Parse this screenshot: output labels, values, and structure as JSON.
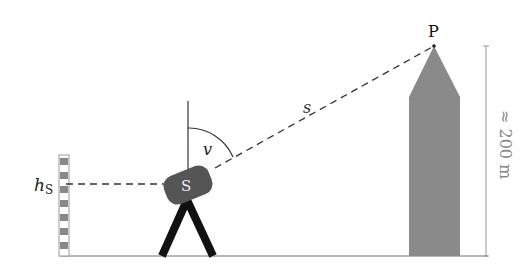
{
  "diagram": {
    "type": "trigonometric-height-measurement",
    "labels": {
      "point": "P",
      "distance": "s",
      "angle": "v",
      "station": "S",
      "station_height": "h",
      "station_height_sub": "S",
      "object_height": "≈ 200 m"
    },
    "colors": {
      "tower": "#8a8a8a",
      "instrument": "#555555",
      "tripod": "#111111",
      "line": "#333333",
      "staff_dark": "#888888",
      "dim_line": "#999999",
      "dim_text": "#888888"
    }
  }
}
